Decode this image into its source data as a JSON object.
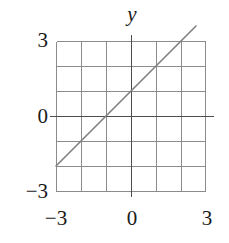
{
  "chart_data": {
    "type": "line",
    "title": "",
    "xlabel": "",
    "ylabel": "y",
    "axis_label_y": "y",
    "xlim": [
      -3,
      3
    ],
    "ylim": [
      -3,
      3
    ],
    "grid": true,
    "grid_step": 1,
    "legend": "none",
    "xticks": [
      -3,
      0,
      3
    ],
    "yticks": [
      -3,
      0,
      3
    ],
    "xtick_labels": [
      "−3",
      "0",
      "3"
    ],
    "ytick_labels": [
      "−3",
      "0",
      "3"
    ],
    "series": [
      {
        "name": "y = x + 1",
        "slope": 1,
        "intercept": 1,
        "x": [
          -3,
          -2,
          -1,
          0,
          1,
          2,
          3
        ],
        "values": [
          -2,
          -1,
          0,
          1,
          2,
          3,
          4
        ],
        "color": "#808080",
        "x_intercept": -1,
        "y_intercept": 1
      }
    ],
    "colors": {
      "grid_line": "#808080",
      "axis_line": "#4d4d4d",
      "data_line": "#808080",
      "text": "#1a1a1a",
      "background": "#ffffff"
    }
  },
  "axes": {
    "y_axis_name": "y",
    "x_tick_minus3": "−3",
    "x_tick_zero": "0",
    "x_tick_three": "3",
    "y_tick_minus3": "−3",
    "y_tick_zero": "0",
    "y_tick_three": "3"
  }
}
